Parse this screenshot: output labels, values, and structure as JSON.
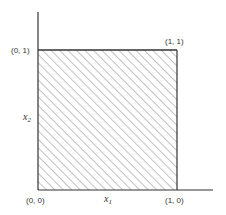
{
  "diagram": {
    "type": "unit-square-region",
    "axes": {
      "x_label": "x",
      "x_label_subscript": "1",
      "y_label": "x",
      "y_label_subscript": "2"
    },
    "corners": [
      {
        "id": "origin",
        "label": "(0, 0)"
      },
      {
        "id": "x-end",
        "label": "(1, 0)"
      },
      {
        "id": "y-end",
        "label": "(0, 1)"
      },
      {
        "id": "top-right",
        "label": "(1, 1)"
      }
    ],
    "region": {
      "description": "hatched unit square",
      "x_range": [
        0,
        1
      ],
      "y_range": [
        0,
        1
      ],
      "fill": "diagonal-hatch",
      "hatch_color": "#777777",
      "edge_color": "#333333"
    }
  }
}
